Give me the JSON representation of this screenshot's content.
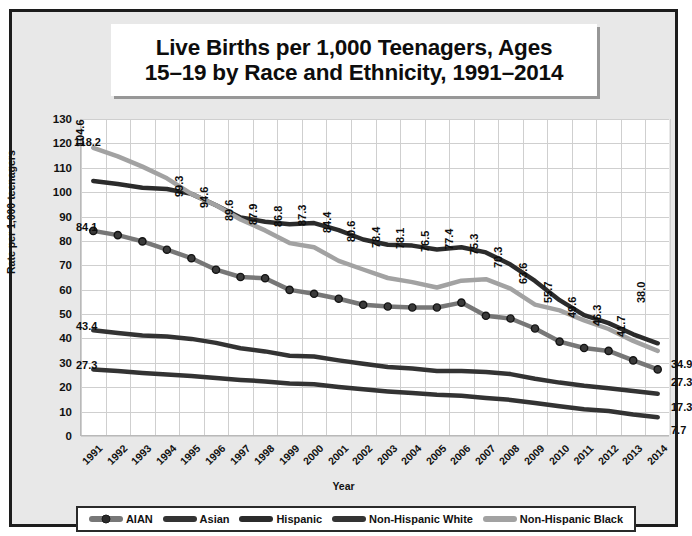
{
  "title": {
    "line1": "Live Births per 1,000 Teenagers, Ages",
    "line2": "15–19 by Race and Ethnicity, 1991–2014"
  },
  "axis": {
    "ylabel": "Rate per 1,000 teenagers",
    "xlabel": "Year"
  },
  "chart_data": {
    "type": "line",
    "title": "Live Births per 1,000 Teenagers, Ages 15–19 by Race and Ethnicity, 1991–2014",
    "xlabel": "Year",
    "ylabel": "Rate per 1,000 teenagers",
    "ylim": [
      0,
      130
    ],
    "yticks": [
      0,
      10,
      20,
      30,
      40,
      50,
      60,
      70,
      80,
      90,
      100,
      110,
      120,
      130
    ],
    "grid": true,
    "legend_position": "bottom",
    "categories": [
      "1991",
      "1992",
      "1993",
      "1994",
      "1995",
      "1996",
      "1997",
      "1998",
      "1999",
      "2000",
      "2001",
      "2002",
      "2003",
      "2004",
      "2005",
      "2006",
      "2007",
      "2008",
      "2009",
      "2010",
      "2011",
      "2012",
      "2013",
      "2014"
    ],
    "series": [
      {
        "name": "Hispanic",
        "color": "#2b2b2b",
        "marker": false,
        "labeled": true,
        "values": [
          104.6,
          103.3,
          101.8,
          101.3,
          99.3,
          94.6,
          89.6,
          87.9,
          86.8,
          87.3,
          84.4,
          80.6,
          78.4,
          78.1,
          76.5,
          77.4,
          75.3,
          70.3,
          63.6,
          55.7,
          49.6,
          46.3,
          41.7,
          38.0
        ],
        "labels": [
          "104.6",
          "",
          "",
          "",
          "99.3",
          "94.6",
          "89.6",
          "87.9",
          "86.8",
          "87.3",
          "84.4",
          "80.6",
          "78.4",
          "78.1",
          "76.5",
          "77.4",
          "75.3",
          "70.3",
          "63.6",
          "55.7",
          "49.6",
          "46.3",
          "41.7",
          "38.0"
        ]
      },
      {
        "name": "Non-Hispanic Black",
        "color": "#a2a2a2",
        "marker": false,
        "labeled": false,
        "values": [
          118.2,
          114.7,
          110.5,
          105.7,
          99.3,
          94.6,
          88.8,
          84.3,
          79.1,
          77.4,
          71.8,
          68.3,
          64.8,
          63.1,
          60.9,
          63.7,
          64.3,
          60.4,
          53.9,
          51.5,
          47.4,
          43.9,
          39.0,
          34.9
        ],
        "labels": [
          "118.2",
          "",
          "",
          "",
          "",
          "",
          "",
          "",
          "",
          "",
          "",
          "",
          "",
          "",
          "",
          "",
          "",
          "",
          "",
          "",
          "",
          "",
          "",
          "34.9"
        ]
      },
      {
        "name": "AIAN",
        "color": "#777777",
        "marker": true,
        "labeled": false,
        "values": [
          84.1,
          82.4,
          79.8,
          76.4,
          72.9,
          68.2,
          65.2,
          64.7,
          59.9,
          58.3,
          56.3,
          53.8,
          53.1,
          52.7,
          52.7,
          54.7,
          49.3,
          48.2,
          44.1,
          38.7,
          36.1,
          34.9,
          31.0,
          27.3
        ],
        "labels": [
          "84.1",
          "",
          "",
          "",
          "",
          "",
          "",
          "",
          "",
          "",
          "",
          "",
          "",
          "",
          "",
          "",
          "",
          "",
          "",
          "",
          "",
          "",
          "",
          "27.3"
        ]
      },
      {
        "name": "Asian",
        "color": "#333333",
        "marker": false,
        "labeled": false,
        "values": [
          43.4,
          42.2,
          41.2,
          40.8,
          39.8,
          38.2,
          36.0,
          34.7,
          32.9,
          32.6,
          31.0,
          29.6,
          28.3,
          27.7,
          26.7,
          26.6,
          26.3,
          25.4,
          23.5,
          21.9,
          20.6,
          19.6,
          18.5,
          17.3
        ],
        "labels": [
          "43.4",
          "",
          "",
          "",
          "",
          "",
          "",
          "",
          "",
          "",
          "",
          "",
          "",
          "",
          "",
          "",
          "",
          "",
          "",
          "",
          "",
          "",
          "",
          "17.3"
        ]
      },
      {
        "name": "Non-Hispanic White",
        "color": "#333333",
        "marker": false,
        "labeled": false,
        "values": [
          27.3,
          26.6,
          25.8,
          25.2,
          24.6,
          23.8,
          23.0,
          22.4,
          21.5,
          21.2,
          20.1,
          19.2,
          18.3,
          17.6,
          16.9,
          16.5,
          15.6,
          14.8,
          13.5,
          12.2,
          11.0,
          10.2,
          8.8,
          7.7
        ],
        "labels": [
          "27.3",
          "",
          "",
          "",
          "",
          "",
          "",
          "",
          "",
          "",
          "",
          "",
          "",
          "",
          "",
          "",
          "",
          "",
          "",
          "",
          "",
          "",
          "",
          "7.7"
        ]
      }
    ],
    "end_labels": [
      "38.0",
      "34.9",
      "27.3",
      "17.3",
      "7.7"
    ]
  },
  "legend": {
    "items": [
      {
        "label": "AIAN",
        "color": "#777777",
        "marker": true
      },
      {
        "label": "Asian",
        "color": "#333333",
        "marker": false
      },
      {
        "label": "Hispanic",
        "color": "#2b2b2b",
        "marker": false
      },
      {
        "label": "Non-Hispanic White",
        "color": "#333333",
        "marker": false
      },
      {
        "label": "Non-Hispanic Black",
        "color": "#a2a2a2",
        "marker": false
      }
    ]
  }
}
